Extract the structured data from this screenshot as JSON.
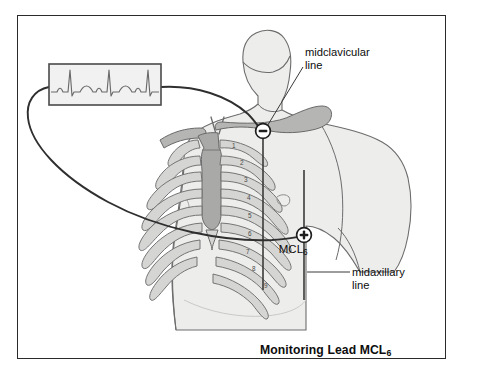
{
  "figure": {
    "caption": "Monitoring Lead MCL",
    "caption_subscript": "6",
    "frame_color": "#2b2b2b",
    "background_color": "#ffffff"
  },
  "labels": {
    "midclavicular": "midclavicular\nline",
    "midaxillary": "midaxillary\nline",
    "mcl_lead": "MCL",
    "mcl_lead_subscript": "6"
  },
  "electrodes": [
    {
      "name": "negative-electrode",
      "symbol": "−",
      "position_description": "right infraclavicular, midclavicular line",
      "x": 263,
      "y": 131
    },
    {
      "name": "positive-electrode",
      "symbol": "+",
      "position_description": "left sixth intercostal space, midaxillary line",
      "x": 304,
      "y": 235
    }
  ],
  "ribs": {
    "numbers": [
      "1",
      "2",
      "3",
      "4",
      "5",
      "6",
      "7",
      "8",
      "9"
    ],
    "bone_fill": "#d5d5d3",
    "bone_stroke": "#6f6f6f"
  },
  "anatomy": {
    "skin_fill": "#ededec",
    "skin_stroke": "#6c6c6c",
    "sternum_fill": "#a9a9a7",
    "clavicle_fill": "#b5b5b3"
  },
  "ecg_monitor": {
    "name": "ecg-waveform-box",
    "border_color": "#4a4a4a",
    "screen_fill": "#f1f1f1",
    "trace_color": "#6a6a6a",
    "beats": 3
  },
  "reference_lines": {
    "midclavicular_color": "#3a3a3a",
    "midaxillary_color": "#3a3a3a",
    "cable_color": "#2f2f2f"
  }
}
